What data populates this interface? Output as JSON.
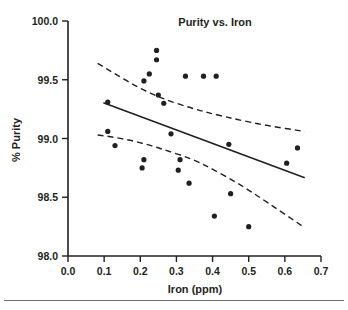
{
  "chart_data": {
    "type": "scatter",
    "title": "Purity vs. Iron",
    "xlabel": "Iron (ppm)",
    "ylabel": "% Purity",
    "xlim": [
      0.0,
      0.7
    ],
    "ylim": [
      98.0,
      100.0
    ],
    "xticks": [
      0.0,
      0.1,
      0.2,
      0.3,
      0.4,
      0.5,
      0.6,
      0.7
    ],
    "xtick_labels": [
      "0.0",
      "0.1",
      "0.2",
      "0.3",
      "0.4",
      "0.5",
      "0.6",
      "0.7"
    ],
    "yticks": [
      98.0,
      98.5,
      99.0,
      99.5,
      100.0
    ],
    "ytick_labels": [
      "98.0",
      "98.5",
      "99.0",
      "99.5",
      "100.0"
    ],
    "grid": false,
    "legend": null,
    "marker_color": "#231f20",
    "line_color": "#231f20",
    "points": [
      {
        "x": 0.11,
        "y": 99.31
      },
      {
        "x": 0.11,
        "y": 99.06
      },
      {
        "x": 0.13,
        "y": 98.94
      },
      {
        "x": 0.21,
        "y": 98.82
      },
      {
        "x": 0.21,
        "y": 99.49
      },
      {
        "x": 0.205,
        "y": 98.75
      },
      {
        "x": 0.225,
        "y": 99.55
      },
      {
        "x": 0.245,
        "y": 99.75
      },
      {
        "x": 0.245,
        "y": 99.67
      },
      {
        "x": 0.25,
        "y": 99.37
      },
      {
        "x": 0.265,
        "y": 99.3
      },
      {
        "x": 0.285,
        "y": 99.04
      },
      {
        "x": 0.305,
        "y": 98.73
      },
      {
        "x": 0.31,
        "y": 98.82
      },
      {
        "x": 0.325,
        "y": 99.53
      },
      {
        "x": 0.335,
        "y": 98.62
      },
      {
        "x": 0.375,
        "y": 99.53
      },
      {
        "x": 0.405,
        "y": 98.34
      },
      {
        "x": 0.41,
        "y": 99.53
      },
      {
        "x": 0.445,
        "y": 98.95
      },
      {
        "x": 0.45,
        "y": 98.53
      },
      {
        "x": 0.5,
        "y": 98.25
      },
      {
        "x": 0.605,
        "y": 98.79
      },
      {
        "x": 0.635,
        "y": 98.92
      }
    ],
    "fit_line": {
      "name": "regression-line",
      "style": "solid",
      "x_start": 0.098,
      "y_start": 99.305,
      "x_end": 0.655,
      "y_end": 98.665
    },
    "confidence_band_upper": {
      "name": "upper-confidence-band",
      "style": "dashed",
      "points": [
        {
          "x": 0.082,
          "y": 99.64
        },
        {
          "x": 0.13,
          "y": 99.55
        },
        {
          "x": 0.18,
          "y": 99.46
        },
        {
          "x": 0.23,
          "y": 99.38
        },
        {
          "x": 0.28,
          "y": 99.32
        },
        {
          "x": 0.34,
          "y": 99.26
        },
        {
          "x": 0.4,
          "y": 99.21
        },
        {
          "x": 0.47,
          "y": 99.16
        },
        {
          "x": 0.55,
          "y": 99.11
        },
        {
          "x": 0.655,
          "y": 99.06
        }
      ]
    },
    "confidence_band_lower": {
      "name": "lower-confidence-band",
      "style": "dashed",
      "points": [
        {
          "x": 0.082,
          "y": 99.03
        },
        {
          "x": 0.13,
          "y": 99.01
        },
        {
          "x": 0.18,
          "y": 98.98
        },
        {
          "x": 0.23,
          "y": 98.94
        },
        {
          "x": 0.28,
          "y": 98.89
        },
        {
          "x": 0.34,
          "y": 98.83
        },
        {
          "x": 0.4,
          "y": 98.74
        },
        {
          "x": 0.47,
          "y": 98.62
        },
        {
          "x": 0.55,
          "y": 98.46
        },
        {
          "x": 0.655,
          "y": 98.24
        }
      ]
    }
  },
  "figure": {
    "title": "Purity vs. Iron",
    "x_axis_title": "Iron (ppm)",
    "y_axis_title": "% Purity"
  }
}
